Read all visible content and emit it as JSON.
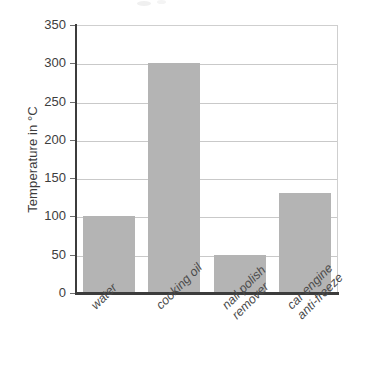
{
  "chart_data": {
    "type": "bar",
    "title": "",
    "subtitle": "",
    "xlabel": "",
    "ylabel": "Temperature in °C",
    "categories": [
      "water",
      "cooking oil",
      "nail polish remover",
      "car engine anti-freeze"
    ],
    "category_lines": [
      [
        "water"
      ],
      [
        "cooking oil"
      ],
      [
        "nail polish",
        "remover"
      ],
      [
        "car engine",
        "anti-freeze"
      ]
    ],
    "values": [
      100,
      300,
      50,
      130
    ],
    "ylim": [
      0,
      350
    ],
    "ytick_step": 50,
    "yticks": [
      350,
      300,
      250,
      200,
      150,
      100,
      50,
      0
    ],
    "ytick_labels": [
      "350",
      "300",
      "250",
      "200",
      "150",
      "100",
      "50",
      "0"
    ],
    "grid": "horizontal",
    "legend": "none",
    "bar_color": "#b4b4b4",
    "gridline_color": "#c9c9c9",
    "axis_color": "#3c3c3c",
    "background_color": "#ffffff",
    "xtick_label_rotation": -45
  }
}
